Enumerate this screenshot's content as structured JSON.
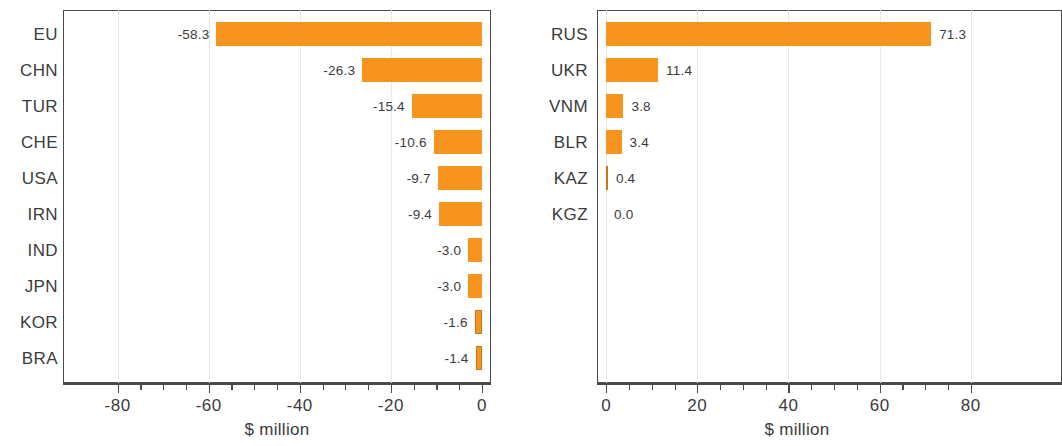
{
  "chart_data": [
    {
      "panel": "left",
      "type": "bar",
      "orientation": "horizontal",
      "title": "",
      "xlabel": "$ million",
      "ylabel": "",
      "xlim": [
        -92,
        2
      ],
      "xticks": [
        -80,
        -60,
        -40,
        -20,
        0
      ],
      "xtick_labels": [
        "-80",
        "-60",
        "-40",
        "-20",
        "0"
      ],
      "grid": true,
      "legend": "none",
      "bar_color": "#F7941E",
      "categories": [
        "EU",
        "CHN",
        "TUR",
        "CHE",
        "USA",
        "IRN",
        "IND",
        "JPN",
        "KOR",
        "BRA"
      ],
      "values": [
        -58.3,
        -26.3,
        -15.4,
        -10.6,
        -9.7,
        -9.4,
        -3.0,
        -3.0,
        -1.6,
        -1.4
      ],
      "value_labels": [
        "-58.3",
        "-26.3",
        "-15.4",
        "-10.6",
        "-9.7",
        "-9.4",
        "-3.0",
        "-3.0",
        "-1.6",
        "-1.4"
      ]
    },
    {
      "panel": "right",
      "type": "bar",
      "orientation": "horizontal",
      "title": "",
      "xlabel": "$ million",
      "ylabel": "",
      "xlim": [
        -2,
        100
      ],
      "xticks": [
        0,
        20,
        40,
        60,
        80
      ],
      "xtick_labels": [
        "0",
        "20",
        "40",
        "60",
        "80"
      ],
      "grid": true,
      "legend": "none",
      "bar_color": "#F7941E",
      "categories": [
        "RUS",
        "UKR",
        "VNM",
        "BLR",
        "KAZ",
        "KGZ"
      ],
      "values": [
        71.3,
        11.4,
        3.8,
        3.4,
        0.4,
        0.0
      ],
      "value_labels": [
        "71.3",
        "11.4",
        "3.8",
        "3.4",
        "0.4",
        "0.0"
      ]
    }
  ],
  "left_chart": {
    "axis_title": "$ million",
    "categories": [
      "EU",
      "CHN",
      "TUR",
      "CHE",
      "USA",
      "IRN",
      "IND",
      "JPN",
      "KOR",
      "BRA"
    ],
    "value_labels": [
      "-58.3",
      "-26.3",
      "-15.4",
      "-10.6",
      "-9.7",
      "-9.4",
      "-3.0",
      "-3.0",
      "-1.6",
      "-1.4"
    ],
    "tick_labels": [
      "-80",
      "-60",
      "-40",
      "-20",
      "0"
    ]
  },
  "right_chart": {
    "axis_title": "$ million",
    "categories": [
      "RUS",
      "UKR",
      "VNM",
      "BLR",
      "KAZ",
      "KGZ"
    ],
    "value_labels": [
      "71.3",
      "11.4",
      "3.8",
      "3.4",
      "0.4",
      "0.0"
    ],
    "tick_labels": [
      "0",
      "20",
      "40",
      "60",
      "80"
    ]
  },
  "colors": {
    "bar": "#F7941E",
    "text": "#3b3b3b",
    "axis": "#4a4a4a",
    "grid": "#e9e9e9"
  }
}
